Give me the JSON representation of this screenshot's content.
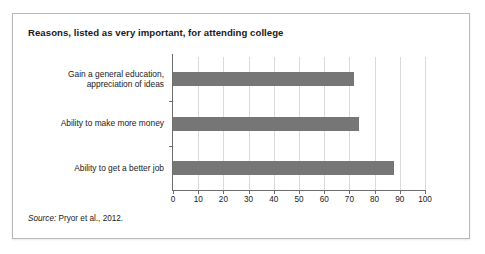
{
  "figure": {
    "title": "Reasons, listed as very important, for attending college",
    "source_label": "Source:",
    "source_text": " Pryor et al., 2012."
  },
  "colors": {
    "bar": "#767676",
    "gridline": "#d9d9d9",
    "axis": "#6e6e6e",
    "frame": "#b9b9b9",
    "text": "#1a1a1a",
    "background": "#ffffff"
  },
  "chart_data": {
    "type": "bar",
    "orientation": "horizontal",
    "title": "Reasons, listed as very important, for attending college",
    "xlabel": "",
    "ylabel": "",
    "xlim": [
      0,
      100
    ],
    "xticks": [
      0,
      10,
      20,
      30,
      40,
      50,
      60,
      70,
      80,
      90,
      100
    ],
    "xticklabels": [
      "0",
      "10",
      "20",
      "30",
      "40",
      "50",
      "60",
      "70",
      "80",
      "90",
      "100"
    ],
    "grid": "vertical",
    "legend": "none",
    "categories": [
      "Gain a general education,\nappreciation of ideas",
      "Ability to make more money",
      "Ability to get a better job"
    ],
    "values": [
      72,
      74,
      87.5
    ],
    "source": "Source: Pryor et al., 2012."
  }
}
